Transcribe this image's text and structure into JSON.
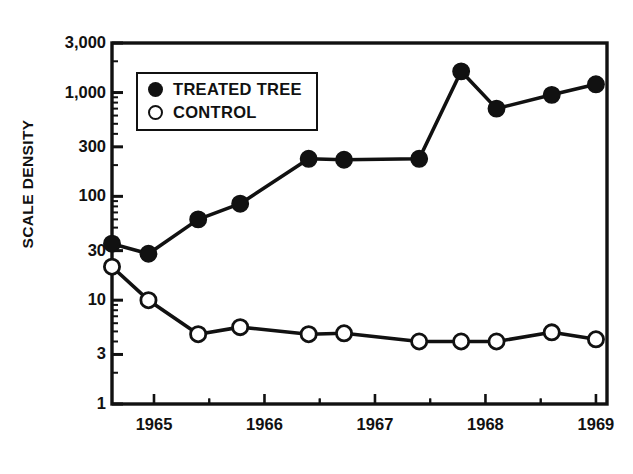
{
  "figure": {
    "kind": "scientific-line-chart",
    "background_color": "#ffffff",
    "ink_color": "#111111"
  },
  "axis": {
    "ylabel": "SCALE DENSITY",
    "y_tick_labels": [
      "3,000",
      "1,000",
      "300",
      "100",
      "30",
      "10",
      "3",
      "1"
    ],
    "x_tick_labels": [
      "1965",
      "1966",
      "1967",
      "1968",
      "1969"
    ]
  },
  "legend": {
    "entries": [
      {
        "marker": "filled-circle-marker",
        "label": "TREATED TREE"
      },
      {
        "marker": "open-circle-marker",
        "label": "CONTROL"
      }
    ]
  },
  "chart_data": {
    "type": "line",
    "title": "",
    "xlabel": "",
    "ylabel": "SCALE DENSITY",
    "yscale": "log",
    "ylim": [
      1,
      3000
    ],
    "y_ticks": [
      1,
      3,
      10,
      30,
      100,
      300,
      1000,
      3000
    ],
    "y_tick_labels": [
      "1",
      "3",
      "10",
      "30",
      "100",
      "300",
      "1,000",
      "3,000"
    ],
    "xlim": [
      1964.62,
      1969.1
    ],
    "x_ticks": [
      1965,
      1966,
      1967,
      1968,
      1969
    ],
    "x_tick_labels": [
      "1965",
      "1966",
      "1967",
      "1968",
      "1969"
    ],
    "grid": false,
    "legend_position": "upper-left-inside",
    "x": [
      1964.62,
      1964.95,
      1965.4,
      1965.78,
      1966.4,
      1966.72,
      1967.4,
      1967.78,
      1968.1,
      1968.6,
      1969.0
    ],
    "series": [
      {
        "name": "TREATED TREE",
        "marker": "filled-circle",
        "color": "#111111",
        "values": [
          35,
          28,
          60,
          85,
          230,
          225,
          230,
          1600,
          700,
          950,
          1200
        ]
      },
      {
        "name": "CONTROL",
        "marker": "open-circle",
        "color": "#111111",
        "values": [
          21,
          10,
          4.7,
          5.5,
          4.7,
          4.8,
          4.0,
          4.0,
          4.0,
          4.9,
          4.2
        ]
      }
    ]
  },
  "plot_geometry": {
    "left": 112,
    "right": 607,
    "top": 43,
    "bottom": 404
  }
}
